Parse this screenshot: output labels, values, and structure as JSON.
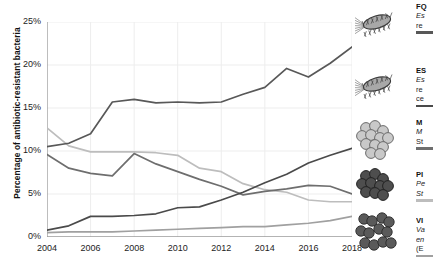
{
  "chart_data": {
    "type": "line",
    "title": "",
    "xlabel": "",
    "ylabel": "Percentage of antibiotic-resistant bacteria",
    "xlim": [
      2004,
      2018
    ],
    "ylim": [
      0,
      25
    ],
    "ytick_labels": [
      "0%",
      "5%",
      "10%",
      "15%",
      "20%",
      "25%"
    ],
    "ytick_values": [
      0,
      5,
      10,
      15,
      20,
      25
    ],
    "xtick_labels": [
      "2004",
      "2006",
      "2008",
      "2010",
      "2012",
      "2014",
      "2016",
      "2018"
    ],
    "xtick_values": [
      2004,
      2006,
      2008,
      2010,
      2012,
      2014,
      2016,
      2018
    ],
    "x": [
      2004,
      2005,
      2006,
      2007,
      2008,
      2009,
      2010,
      2011,
      2012,
      2013,
      2014,
      2015,
      2016,
      2017,
      2018
    ],
    "grid": true,
    "legend_position": "right",
    "series": [
      {
        "name": "FQRE",
        "color": "#585858",
        "values": [
          10.5,
          10.9,
          12.0,
          15.7,
          16.0,
          15.6,
          15.7,
          15.6,
          15.7,
          16.6,
          17.4,
          19.6,
          18.6,
          20.2,
          22.1
        ]
      },
      {
        "name": "ESBL",
        "color": "#4a4a4a",
        "values": [
          0.8,
          1.3,
          2.4,
          2.4,
          2.5,
          2.7,
          3.4,
          3.5,
          4.3,
          5.2,
          6.3,
          7.3,
          8.6,
          9.5,
          10.3
        ]
      },
      {
        "name": "MRSA",
        "color": "#6e6e6e",
        "values": [
          9.6,
          8.0,
          7.4,
          7.1,
          9.7,
          8.5,
          7.6,
          6.7,
          5.9,
          4.9,
          5.3,
          5.6,
          6.0,
          5.9,
          5.0
        ]
      },
      {
        "name": "PRSP",
        "color": "#bdbdbd",
        "values": [
          12.7,
          10.6,
          9.9,
          9.9,
          9.9,
          9.8,
          9.5,
          8.0,
          7.6,
          6.2,
          5.5,
          5.2,
          4.3,
          4.1,
          4.1
        ]
      },
      {
        "name": "VRE",
        "color": "#a0a0a0",
        "values": [
          0.5,
          0.6,
          0.6,
          0.6,
          0.7,
          0.8,
          0.9,
          1.0,
          1.1,
          1.2,
          1.2,
          1.4,
          1.6,
          1.9,
          2.4
        ]
      }
    ]
  },
  "legend": {
    "items": [
      {
        "name": "FQ",
        "sub1": "Es",
        "sub2": "re",
        "icon": "rod-bacterium-flagella-icon",
        "color": "#585858"
      },
      {
        "name": "ES",
        "sub1": "Es",
        "sub2": "re",
        "sub3": "ce",
        "icon": "rod-bacterium-flagella-icon",
        "color": "#4a4a4a"
      },
      {
        "name": "M",
        "sub1": "M",
        "sub2": "St",
        "icon": "cocci-cluster-light-icon",
        "color": "#6e6e6e"
      },
      {
        "name": "PI",
        "sub1": "Pe",
        "sub2": "St",
        "icon": "cocci-cluster-dark-icon",
        "color": "#bdbdbd"
      },
      {
        "name": "VI",
        "sub1": "Va",
        "sub2": "en",
        "sub3": "(E",
        "icon": "cocci-pairs-dark-icon",
        "color": "#a0a0a0"
      }
    ]
  }
}
